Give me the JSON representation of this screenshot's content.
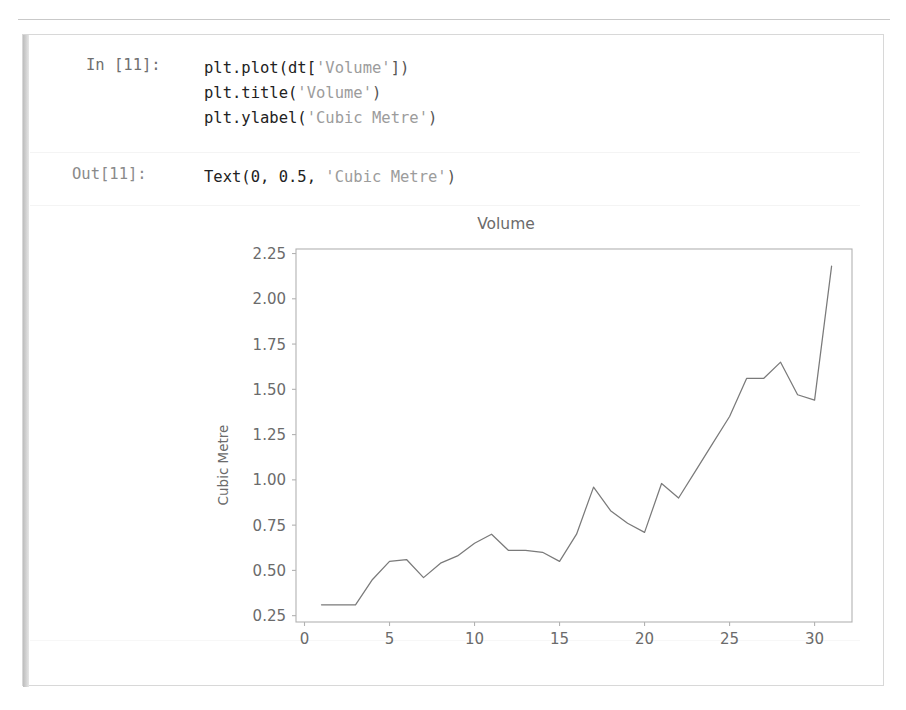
{
  "notebook": {
    "in_prompt": "In [11]:",
    "out_prompt": "Out[11]:",
    "code_lines": [
      "plt.plot(dt['Volume'])",
      "plt.title('Volume')",
      "plt.ylabel('Cubic Metre')"
    ],
    "code_tokens": {
      "line1_a": "plt.plot(dt[",
      "line1_s": "'Volume'",
      "line1_b": "])",
      "line2_a": "plt.title(",
      "line2_s": "'Volume'",
      "line2_b": ")",
      "line3_a": "plt.ylabel(",
      "line3_s": "'Cubic Metre'",
      "line3_b": ")"
    },
    "output_text": "Text(0, 0.5, 'Cubic Metre')",
    "output_tokens": {
      "a": "Text(0, 0.5, ",
      "s": "'Cubic Metre'",
      "b": ")"
    }
  },
  "colors": {
    "line": "#7a7a7a",
    "axis": "#9a9a9a",
    "text": "#6b6b6b",
    "gutter": "#bdbdbd",
    "cell_border": "#d8d8d8"
  },
  "chart_data": {
    "type": "line",
    "title": "Volume",
    "xlabel": "",
    "ylabel": "Cubic Metre",
    "grid": false,
    "legend": false,
    "xlim": [
      -0.5,
      32.2
    ],
    "ylim": [
      0.215,
      2.275
    ],
    "xticks": [
      0,
      5,
      10,
      15,
      20,
      25,
      30
    ],
    "xticklabels": [
      "0",
      "5",
      "10",
      "15",
      "20",
      "25",
      "30"
    ],
    "yticks": [
      0.25,
      0.5,
      0.75,
      1.0,
      1.25,
      1.5,
      1.75,
      2.0,
      2.25
    ],
    "yticklabels": [
      "0.25",
      "0.50",
      "0.75",
      "1.00",
      "1.25",
      "1.50",
      "1.75",
      "2.00",
      "2.25"
    ],
    "series": [
      {
        "name": "Volume",
        "x": [
          1,
          2,
          3,
          4,
          5,
          6,
          7,
          8,
          9,
          10,
          11,
          12,
          13,
          14,
          15,
          16,
          17,
          18,
          19,
          20,
          21,
          22,
          23,
          24,
          25,
          26,
          27,
          28,
          29,
          30,
          31
        ],
        "values": [
          0.31,
          0.31,
          0.31,
          0.45,
          0.55,
          0.56,
          0.46,
          0.54,
          0.58,
          0.65,
          0.7,
          0.61,
          0.61,
          0.6,
          0.55,
          0.7,
          0.96,
          0.83,
          0.76,
          0.71,
          0.98,
          0.9,
          1.05,
          1.2,
          1.35,
          1.56,
          1.56,
          1.65,
          1.47,
          1.44,
          2.18
        ]
      }
    ]
  }
}
